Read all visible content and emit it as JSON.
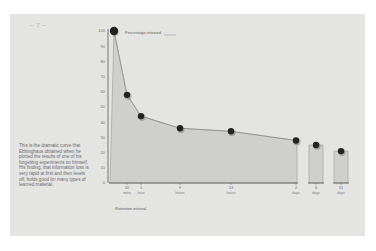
{
  "page": {
    "caption": "This is the dramatic curve that Ebbinghaus obtained when he plotted the results of one of his forgetting experiments on himself. His finding, that information loss is very rapid at first and then levels off, holds good for many types of learned material.",
    "margin_mark": "~ 7 ~"
  },
  "chart_data": {
    "type": "line",
    "title": "",
    "ylabel": "Percentage retained",
    "xlabel": "Retention interval",
    "ylim": [
      0,
      100
    ],
    "y_ticks": [
      100,
      90,
      80,
      70,
      60,
      50,
      40,
      30,
      20,
      10,
      0
    ],
    "grid": false,
    "area_fill": true,
    "x_axis_broken": true,
    "categories": [
      {
        "value": "0",
        "unit": ""
      },
      {
        "value": "20",
        "unit": "mins"
      },
      {
        "value": "1",
        "unit": "hour"
      },
      {
        "value": "9",
        "unit": "hours"
      },
      {
        "value": "24",
        "unit": "hours"
      },
      {
        "value": "2",
        "unit": "days"
      },
      {
        "value": "6",
        "unit": "days"
      },
      {
        "value": "31",
        "unit": "days"
      }
    ],
    "series": [
      {
        "name": "Percentage retained",
        "values": [
          100,
          58,
          44,
          36,
          34,
          28,
          25,
          21
        ]
      }
    ],
    "colors": {
      "fill": "#cfcfcd",
      "line": "#8a8a8a",
      "axis": "#6a6a6a",
      "marker": "#222222"
    }
  }
}
